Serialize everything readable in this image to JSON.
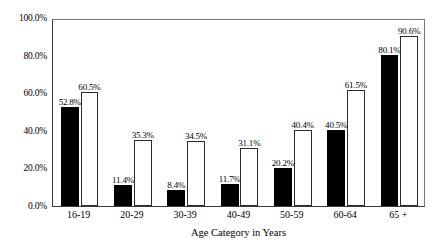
{
  "chart_data": {
    "type": "bar",
    "title": "",
    "subtitle": "",
    "xlabel": "Age Category in Years",
    "ylabel": "",
    "ylim": [
      0,
      100
    ],
    "yticks": [
      "0.0%",
      "20.0%",
      "40.0%",
      "60.0%",
      "80.0%",
      "100.0%"
    ],
    "ytick_values": [
      0,
      20,
      40,
      60,
      80,
      100
    ],
    "grid": false,
    "legend": "none",
    "categories": [
      "16-19",
      "20-29",
      "30-39",
      "40-49",
      "50-59",
      "60-64",
      "65 +"
    ],
    "series": [
      {
        "name": "series-a",
        "color": "#000000",
        "values": [
          52.8,
          11.4,
          8.4,
          11.7,
          20.2,
          40.5,
          80.1
        ],
        "labels": [
          "52.8%",
          "11.4%",
          "8.4%",
          "11.7%",
          "20.2%",
          "40.5%",
          "80.1%"
        ]
      },
      {
        "name": "series-b",
        "color": "#ffffff",
        "values": [
          60.5,
          35.3,
          34.5,
          31.1,
          40.4,
          61.5,
          90.6
        ],
        "labels": [
          "60.5%",
          "35.3%",
          "34.5%",
          "31.1%",
          "40.4%",
          "61.5%",
          "90.6%"
        ]
      }
    ]
  },
  "colors": {
    "series_a_fill": "#000000",
    "series_b_fill": "#ffffff",
    "bar_outline": "#2b2b2b",
    "axis": "#3a3a3a",
    "frame": "#7a7a7a",
    "background": "#ffffff",
    "text": "#000000"
  }
}
